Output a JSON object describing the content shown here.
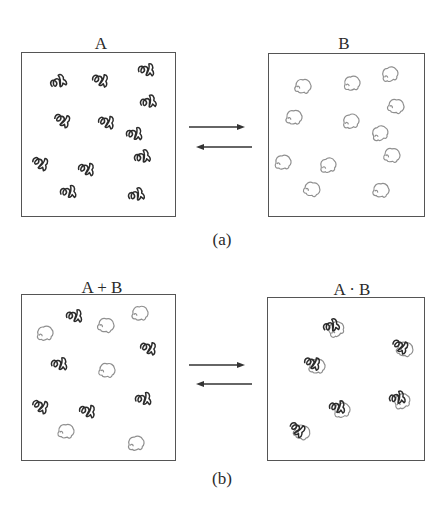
{
  "figure": {
    "part_a": {
      "caption": "(a)",
      "left_box": {
        "label": "A",
        "molecules": [
          {
            "type": "A",
            "x": 58,
            "y": 82
          },
          {
            "type": "A",
            "x": 100,
            "y": 80
          },
          {
            "type": "A",
            "x": 146,
            "y": 70
          },
          {
            "type": "A",
            "x": 148,
            "y": 102
          },
          {
            "type": "A",
            "x": 62,
            "y": 120
          },
          {
            "type": "A",
            "x": 106,
            "y": 122
          },
          {
            "type": "A",
            "x": 134,
            "y": 134
          },
          {
            "type": "A",
            "x": 142,
            "y": 157
          },
          {
            "type": "A",
            "x": 40,
            "y": 163
          },
          {
            "type": "A",
            "x": 86,
            "y": 169
          },
          {
            "type": "A",
            "x": 68,
            "y": 192
          },
          {
            "type": "A",
            "x": 136,
            "y": 195
          }
        ]
      },
      "right_box": {
        "label": "B",
        "molecules": [
          {
            "type": "B",
            "x": 303,
            "y": 86
          },
          {
            "type": "B",
            "x": 352,
            "y": 83
          },
          {
            "type": "B",
            "x": 390,
            "y": 74
          },
          {
            "type": "B",
            "x": 396,
            "y": 106
          },
          {
            "type": "B",
            "x": 294,
            "y": 117
          },
          {
            "type": "B",
            "x": 351,
            "y": 121
          },
          {
            "type": "B",
            "x": 380,
            "y": 133
          },
          {
            "type": "B",
            "x": 392,
            "y": 155
          },
          {
            "type": "B",
            "x": 283,
            "y": 162
          },
          {
            "type": "B",
            "x": 328,
            "y": 165
          },
          {
            "type": "B",
            "x": 312,
            "y": 189
          },
          {
            "type": "B",
            "x": 381,
            "y": 190
          }
        ]
      },
      "equilibrium": {
        "forward": "right-arrow",
        "reverse": "left-arrow"
      }
    },
    "part_b": {
      "caption": "(b)",
      "left_box": {
        "label": "A + B",
        "molecules": [
          {
            "type": "B",
            "x": 45,
            "y": 333
          },
          {
            "type": "A",
            "x": 74,
            "y": 316
          },
          {
            "type": "B",
            "x": 106,
            "y": 325
          },
          {
            "type": "B",
            "x": 140,
            "y": 313
          },
          {
            "type": "A",
            "x": 148,
            "y": 348
          },
          {
            "type": "A",
            "x": 59,
            "y": 364
          },
          {
            "type": "B",
            "x": 107,
            "y": 370
          },
          {
            "type": "A",
            "x": 40,
            "y": 406
          },
          {
            "type": "A",
            "x": 87,
            "y": 411
          },
          {
            "type": "A",
            "x": 143,
            "y": 399
          },
          {
            "type": "B",
            "x": 66,
            "y": 431
          },
          {
            "type": "B",
            "x": 136,
            "y": 443
          }
        ]
      },
      "right_box": {
        "label": "A · B",
        "complexes": [
          {
            "x": 333,
            "y": 327
          },
          {
            "x": 402,
            "y": 347
          },
          {
            "x": 314,
            "y": 364
          },
          {
            "x": 339,
            "y": 408
          },
          {
            "x": 399,
            "y": 399
          },
          {
            "x": 299,
            "y": 430
          }
        ]
      },
      "equilibrium": {
        "forward": "right-arrow",
        "reverse": "left-arrow"
      }
    },
    "colors": {
      "molecule_A": "#2b2b2b",
      "molecule_B": "#8f8f8f",
      "box_border": "#555555",
      "arrow": "#333333"
    }
  }
}
